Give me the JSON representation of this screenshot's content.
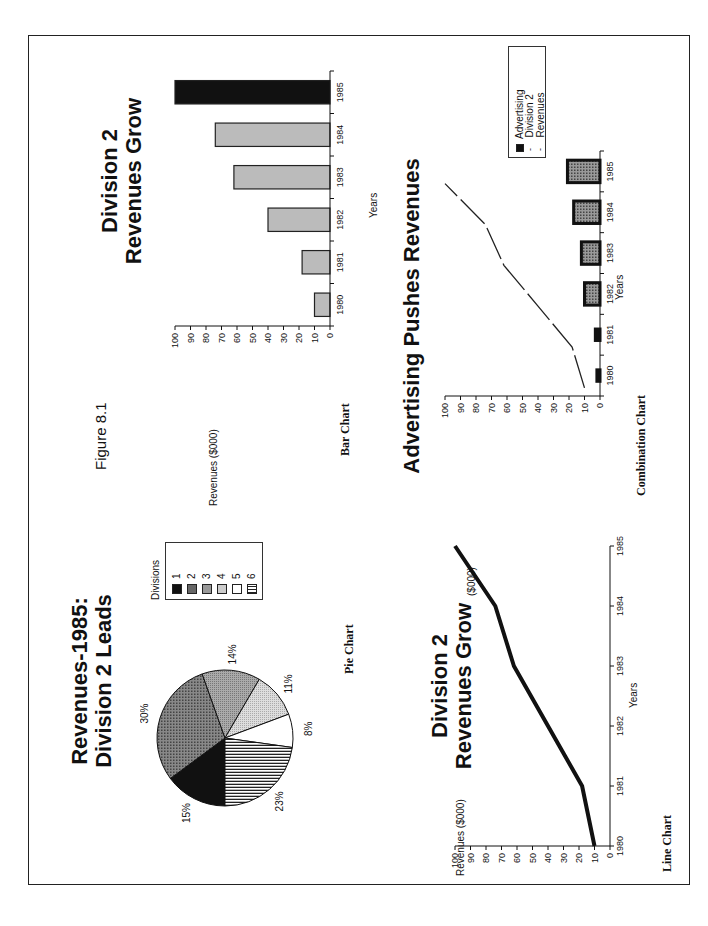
{
  "figure": {
    "label": "Figure 8.1"
  },
  "pie": {
    "title_line1": "Revenues-1985:",
    "title_line2": "Division 2 Leads",
    "caption": "Pie Chart",
    "legend_title": "Divisions",
    "legend": [
      "1",
      "2",
      "3",
      "4",
      "5",
      "6"
    ],
    "labels": [
      "15%",
      "30%",
      "14%",
      "11%",
      "8%",
      "23%"
    ]
  },
  "bar": {
    "title_line1": "Division  2",
    "title_line2": "Revenues Grow",
    "ylabel": "Revenues ($000)",
    "xlabel": "Years",
    "caption": "Bar Chart"
  },
  "line": {
    "title_line1": "Division  2",
    "title_line2": "Revenues Grow",
    "ylabel": "Revenues ($000)",
    "xlabel": "Years",
    "caption": "Line Chart"
  },
  "combo": {
    "title": "Advertising Pushes Revenues",
    "ylabel": "($000)",
    "xlabel": "Years",
    "caption": "Combination Chart",
    "legend": [
      "Advertising",
      "Division 2 Revenues"
    ]
  },
  "chart_data": [
    {
      "type": "pie",
      "title": "Revenues-1985: Division 2 Leads",
      "categories": [
        "1",
        "2",
        "3",
        "4",
        "5",
        "6"
      ],
      "values": [
        15,
        30,
        14,
        11,
        8,
        23
      ],
      "legend_title": "Divisions",
      "legend_position": "right",
      "caption": "Pie Chart"
    },
    {
      "type": "bar",
      "title": "Division 2 Revenues Grow",
      "categories": [
        "1980",
        "1981",
        "1982",
        "1983",
        "1984",
        "1985"
      ],
      "values": [
        10,
        18,
        40,
        62,
        74,
        100
      ],
      "xlabel": "Years",
      "ylabel": "Revenues ($000)",
      "ylim": [
        0,
        100
      ],
      "yticks": [
        0,
        10,
        20,
        30,
        40,
        50,
        60,
        70,
        80,
        90,
        100
      ],
      "grid": false,
      "caption": "Bar Chart"
    },
    {
      "type": "line",
      "title": "Division 2 Revenues Grow",
      "x": [
        "1980",
        "1981",
        "1982",
        "1983",
        "1984",
        "1985"
      ],
      "values": [
        10,
        18,
        40,
        62,
        74,
        100
      ],
      "xlabel": "Years",
      "ylabel": "Revenues ($000)",
      "ylim": [
        0,
        100
      ],
      "yticks": [
        0,
        10,
        20,
        30,
        40,
        50,
        60,
        70,
        80,
        90,
        100
      ],
      "grid": false,
      "caption": "Line Chart"
    },
    {
      "type": "bar",
      "subtype": "combination",
      "title": "Advertising Pushes Revenues",
      "categories": [
        "1980",
        "1981",
        "1982",
        "1983",
        "1984",
        "1985"
      ],
      "series": [
        {
          "name": "Advertising",
          "type": "bar",
          "values": [
            2,
            3,
            10,
            12,
            17,
            21
          ]
        },
        {
          "name": "Division 2 Revenues",
          "type": "line",
          "style": "dashed",
          "values": [
            10,
            18,
            40,
            62,
            74,
            100
          ]
        }
      ],
      "xlabel": "Years",
      "ylabel": "($000)",
      "ylim": [
        0,
        100
      ],
      "yticks": [
        0,
        10,
        20,
        30,
        40,
        50,
        60,
        70,
        80,
        90,
        100
      ],
      "legend_position": "upper right",
      "caption": "Combination Chart"
    }
  ]
}
